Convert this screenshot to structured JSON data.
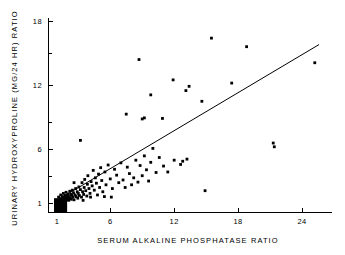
{
  "chart_data": {
    "type": "scatter",
    "title": "",
    "xlabel": "SERUM  ALKALINE  PHOSPHATASE  RATIO",
    "ylabel": "URINARY  HYDROXYPROLINE  (MG/24 HR) RATIO",
    "xlim": [
      0.0,
      26.5
    ],
    "ylim": [
      0.0,
      18.8
    ],
    "xticks": [
      1,
      6,
      12,
      18,
      24
    ],
    "xtick_labels": [
      "1",
      "6",
      "12",
      "18",
      "24"
    ],
    "yticks": [
      1,
      6,
      12,
      18
    ],
    "ytick_labels": [
      "1",
      "6",
      "12",
      "18"
    ],
    "y_minor_ticks": [
      3.5,
      8.5,
      15
    ],
    "grid": false,
    "legend": null,
    "fit_line": {
      "label": "regression line",
      "x_start": 1.0,
      "y_start": 1.25,
      "x_end": 25.6,
      "y_end": 15.8
    },
    "origin_marker": {
      "label": "overplotted-cluster-block",
      "x_range": [
        0.72,
        1.95
      ],
      "y_range": [
        0.15,
        1.45
      ]
    },
    "points": [
      [
        1.15,
        1.55
      ],
      [
        1.3,
        1.4
      ],
      [
        1.35,
        1.75
      ],
      [
        1.45,
        1.2
      ],
      [
        1.5,
        1.6
      ],
      [
        1.55,
        1.35
      ],
      [
        1.6,
        1.9
      ],
      [
        1.65,
        1.5
      ],
      [
        1.7,
        1.15
      ],
      [
        1.75,
        1.7
      ],
      [
        1.8,
        1.45
      ],
      [
        1.85,
        2.0
      ],
      [
        1.9,
        1.3
      ],
      [
        1.95,
        1.65
      ],
      [
        2.0,
        1.5
      ],
      [
        2.05,
        1.85
      ],
      [
        2.1,
        1.25
      ],
      [
        2.15,
        1.6
      ],
      [
        2.2,
        2.1
      ],
      [
        2.25,
        1.45
      ],
      [
        2.3,
        1.8
      ],
      [
        2.35,
        1.35
      ],
      [
        2.4,
        1.7
      ],
      [
        2.45,
        2.2
      ],
      [
        2.5,
        1.55
      ],
      [
        2.55,
        1.95
      ],
      [
        2.6,
        1.3
      ],
      [
        2.7,
        1.75
      ],
      [
        2.75,
        2.35
      ],
      [
        2.8,
        1.6
      ],
      [
        2.9,
        2.05
      ],
      [
        2.95,
        1.45
      ],
      [
        3.0,
        1.9
      ],
      [
        3.05,
        2.5
      ],
      [
        3.1,
        1.7
      ],
      [
        3.2,
        2.25
      ],
      [
        3.3,
        1.55
      ],
      [
        3.35,
        2.9
      ],
      [
        3.4,
        2.05
      ],
      [
        3.5,
        1.8
      ],
      [
        3.55,
        2.45
      ],
      [
        3.6,
        3.2
      ],
      [
        3.7,
        2.15
      ],
      [
        3.8,
        1.65
      ],
      [
        3.85,
        2.75
      ],
      [
        3.9,
        3.55
      ],
      [
        4.0,
        2.35
      ],
      [
        4.1,
        1.9
      ],
      [
        4.2,
        3.0
      ],
      [
        4.3,
        2.6
      ],
      [
        4.4,
        4.05
      ],
      [
        4.5,
        2.2
      ],
      [
        4.6,
        3.35
      ],
      [
        4.7,
        2.85
      ],
      [
        4.8,
        1.75
      ],
      [
        4.9,
        3.7
      ],
      [
        5.0,
        2.45
      ],
      [
        5.1,
        4.3
      ],
      [
        5.2,
        3.1
      ],
      [
        5.3,
        2.05
      ],
      [
        5.5,
        3.9
      ],
      [
        5.6,
        2.7
      ],
      [
        5.8,
        4.55
      ],
      [
        6.0,
        3.25
      ],
      [
        6.2,
        2.35
      ],
      [
        6.4,
        4.15
      ],
      [
        6.6,
        3.6
      ],
      [
        6.8,
        2.9
      ],
      [
        7.0,
        4.75
      ],
      [
        7.2,
        3.15
      ],
      [
        7.4,
        2.45
      ],
      [
        7.6,
        4.35
      ],
      [
        7.8,
        3.75
      ],
      [
        8.0,
        2.7
      ],
      [
        8.2,
        3.35
      ],
      [
        8.4,
        5.0
      ],
      [
        8.6,
        2.95
      ],
      [
        8.8,
        4.5
      ],
      [
        9.0,
        3.55
      ],
      [
        9.2,
        5.4
      ],
      [
        9.4,
        4.1
      ],
      [
        9.6,
        3.05
      ],
      [
        9.8,
        4.8
      ],
      [
        10.0,
        6.1
      ],
      [
        10.3,
        3.85
      ],
      [
        10.6,
        5.25
      ],
      [
        11.0,
        4.45
      ],
      [
        11.4,
        3.9
      ],
      [
        12.0,
        5.0
      ],
      [
        12.6,
        4.6
      ],
      [
        13.2,
        5.1
      ],
      [
        3.2,
        6.85
      ],
      [
        7.5,
        9.3
      ],
      [
        8.7,
        14.4
      ],
      [
        9.2,
        8.95
      ],
      [
        9.0,
        8.85
      ],
      [
        9.8,
        11.1
      ],
      [
        10.9,
        8.9
      ],
      [
        11.9,
        12.5
      ],
      [
        13.1,
        11.5
      ],
      [
        13.4,
        11.9
      ],
      [
        14.6,
        10.5
      ],
      [
        14.9,
        2.15
      ],
      [
        15.5,
        16.4
      ],
      [
        17.4,
        12.2
      ],
      [
        18.8,
        15.6
      ],
      [
        21.3,
        6.6
      ],
      [
        21.4,
        6.25
      ],
      [
        25.2,
        14.1
      ],
      [
        12.8,
        4.9
      ],
      [
        2.6,
        2.9
      ],
      [
        3.45,
        1.25
      ],
      [
        4.15,
        1.55
      ],
      [
        5.45,
        1.6
      ],
      [
        6.1,
        1.55
      ]
    ]
  }
}
